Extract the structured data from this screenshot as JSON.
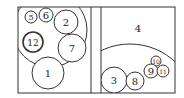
{
  "diagram": {
    "type": "circle-packing",
    "stroke_color": "#333333",
    "background": "#ffffff",
    "left_panel": {
      "box": {
        "x": 18,
        "y": 7,
        "w": 73,
        "h": 86
      },
      "region_arc": {
        "cx": 50,
        "cy": 30,
        "r": 37
      },
      "circles": [
        {
          "label": "5",
          "cx": 31,
          "cy": 17,
          "r": 6
        },
        {
          "label": "6",
          "cx": 46,
          "cy": 15,
          "r": 7
        },
        {
          "label": "2",
          "cx": 66,
          "cy": 22,
          "r": 12
        },
        {
          "label": "12",
          "cx": 33,
          "cy": 42,
          "r": 10,
          "bold": true
        },
        {
          "label": "7",
          "cx": 72,
          "cy": 48,
          "r": 14
        },
        {
          "label": "1",
          "cx": 48,
          "cy": 73,
          "r": 16
        }
      ]
    },
    "right_panel": {
      "box": {
        "x": 101,
        "y": 7,
        "w": 74,
        "h": 86
      },
      "region_label": {
        "label": "4",
        "x": 138,
        "y": 28
      },
      "region_arc": {
        "cx": 130,
        "cy": 110,
        "r": 66
      },
      "circles": [
        {
          "label": "3",
          "cx": 114,
          "cy": 80,
          "r": 13
        },
        {
          "label": "8",
          "cx": 135,
          "cy": 81,
          "r": 9
        },
        {
          "label": "10",
          "cx": 156,
          "cy": 61,
          "r": 5
        },
        {
          "label": "9",
          "cx": 151,
          "cy": 71,
          "r": 7
        },
        {
          "label": "11",
          "cx": 163,
          "cy": 71,
          "r": 6
        }
      ]
    }
  }
}
